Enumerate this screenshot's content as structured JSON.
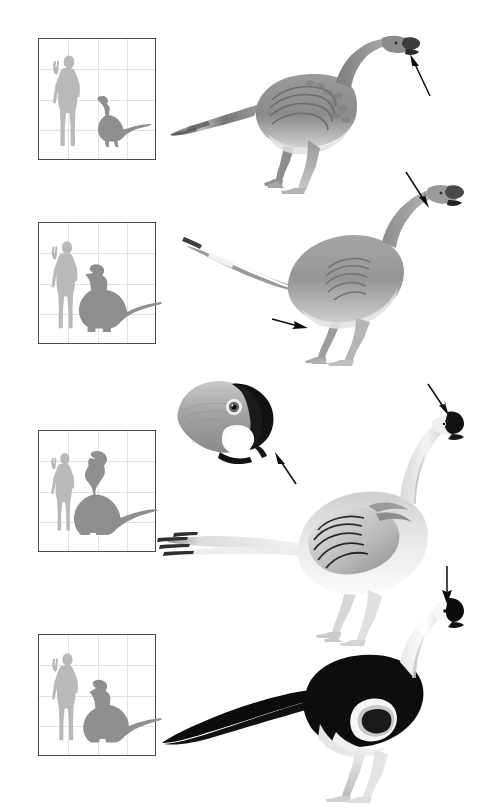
{
  "figure": {
    "background_color": "#ffffff",
    "width": 486,
    "height": 808,
    "panel_count": 4
  },
  "palette": {
    "silhouette_human": "#b9b9b9",
    "silhouette_dino": "#8f8f8f",
    "grid_line": "#e2e2e2",
    "box_border": "#4a4a4a",
    "arrow": "#0d0d0d",
    "body_mid_gray": "#8c8c8c",
    "body_light_gray": "#c9c9c9",
    "body_dark": "#3b3b3b",
    "crest_black": "#111111",
    "white": "#ffffff"
  },
  "panels": [
    {
      "id": "panel-1",
      "name": "panel-one",
      "scale_box": {
        "name": "scale-box-1",
        "human_label": "human figure with raised arm",
        "dino_label": "dinosaur silhouette, small, upright neck with long tail",
        "grid_columns": 3,
        "grid_rows": 3,
        "box_x": 38,
        "box_y": 38,
        "box_w": 118,
        "box_h": 122
      },
      "animal": {
        "name": "oviraptorosaur-restoration-1",
        "plumage": "mid gray body with scaled and banded feather texture",
        "head": "dark hooked beak, short rounded head",
        "tail": "long banded tail feathers sweeping left and down",
        "pose": "standing, neck arched forward, two legs visible"
      },
      "arrows": [
        {
          "name": "arrow-to-beak-1",
          "direction": "up-left",
          "target": "dark beak tip"
        }
      ],
      "head_inset": null
    },
    {
      "id": "panel-2",
      "name": "panel-two",
      "scale_box": {
        "name": "scale-box-2",
        "human_label": "human figure with raised arm",
        "dino_label": "dinosaur silhouette, medium, with very long sweeping tail",
        "grid_columns": 3,
        "grid_rows": 3,
        "box_x": 38,
        "box_y": 222,
        "box_w": 118,
        "box_h": 122
      },
      "animal": {
        "name": "oviraptorosaur-restoration-2",
        "plumage": "smooth pale gray body, lighter belly, subtle wing feather arcs on flank",
        "head": "small dark-tipped beak, slender curving neck",
        "tail": "long straight tail with dark and white banded tip",
        "pose": "standing, long horizontal tail, head raised at right"
      },
      "arrows": [
        {
          "name": "arrow-to-beak-2",
          "direction": "down-right",
          "target": "dark beak"
        },
        {
          "name": "arrow-to-flank-2",
          "direction": "right",
          "target": "hind limb and flank feathers"
        }
      ],
      "head_inset": null
    },
    {
      "id": "panel-3",
      "name": "panel-three",
      "scale_box": {
        "name": "scale-box-3",
        "human_label": "human figure with raised arm",
        "dino_label": "dinosaur silhouette, large, tall neck and long tail",
        "grid_columns": 3,
        "grid_rows": 3,
        "box_x": 38,
        "box_y": 430,
        "box_w": 118,
        "box_h": 122
      },
      "animal": {
        "name": "oviraptorosaur-restoration-3",
        "plumage": "pale white-gray body with prominent layered wing feathers",
        "head": "black crest and beak, white face and neck",
        "tail": "long pale tail with dark banded feather tips at the end",
        "pose": "standing, neck upright, large folded wing on flank"
      },
      "arrows": [
        {
          "name": "arrow-to-crest-3",
          "direction": "down-right",
          "target": "black head crest"
        }
      ],
      "head_inset": {
        "name": "head-close-up-inset",
        "description": "close-up of skull showing deep beak, eye with white ring, black crest and a white tooth-like projection",
        "arrow": {
          "name": "arrow-to-beak-projection",
          "direction": "up-left",
          "target": "white beak projection"
        }
      }
    },
    {
      "id": "panel-4",
      "name": "panel-four",
      "scale_box": {
        "name": "scale-box-4",
        "human_label": "human figure with raised arm",
        "dino_label": "dinosaur silhouette, medium-large, long tapering tail",
        "grid_columns": 3,
        "grid_rows": 3,
        "box_x": 38,
        "box_y": 634,
        "box_w": 118,
        "box_h": 122
      },
      "animal": {
        "name": "oviraptorosaur-restoration-4",
        "plumage": "high contrast black body and tail with white neck, head and legs",
        "head": "black crest and beak on a white head",
        "tail": "very long solid black tapering tail",
        "pose": "standing, body horizontal, neck curving up at right"
      },
      "arrows": [
        {
          "name": "arrow-to-crest-4",
          "direction": "down",
          "target": "black head crest"
        }
      ],
      "head_inset": null
    }
  ]
}
